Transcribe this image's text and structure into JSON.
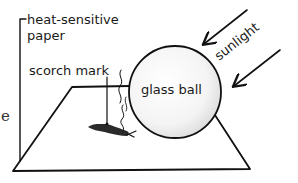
{
  "diagram": {
    "labels": {
      "paper": [
        "heat-sensitive",
        "paper"
      ],
      "scorch": "scorch mark",
      "ball": "glass ball",
      "sunlight": "sunlight",
      "edge_fragment": "e"
    },
    "colors": {
      "ink": "#111111",
      "scorch": "#2b2b2b",
      "ball_shade": "#e6e6e6",
      "background": "#ffffff"
    },
    "elements": {
      "paper_sheet": "quadrilateral sheet lying flat",
      "glass_ball": "sphere resting on paper",
      "sunlight_arrows": 2,
      "heat_wisps": 2
    }
  }
}
